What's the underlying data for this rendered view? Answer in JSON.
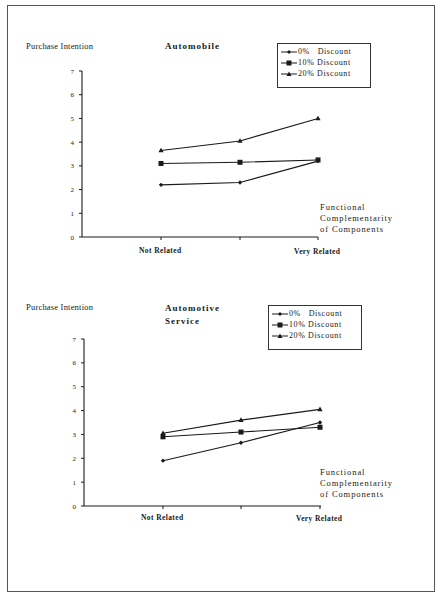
{
  "page": {
    "frame": true,
    "ink_color": "#1a1a1a"
  },
  "chart_data": [
    {
      "type": "line",
      "title": "Automobile",
      "ylabel": "Purchase Intention",
      "xlabel": "Functional Complementarity of Components",
      "xlabel_lines": [
        "Functional",
        "Complementarity",
        "of Components"
      ],
      "x": [
        "Not Related",
        "",
        "Very Related"
      ],
      "x_tick_labels": [
        "Not Related",
        "Very Related"
      ],
      "y_ticks": [
        "0",
        "1",
        "2",
        "3",
        "4",
        "5",
        "6",
        "7"
      ],
      "ylim": [
        0,
        7
      ],
      "grid": false,
      "legend_position": "top-right (boxed)",
      "series": [
        {
          "name": "0% Discount",
          "marker": "diamond",
          "values": [
            2.2,
            2.3,
            3.2
          ]
        },
        {
          "name": "10% Discount",
          "marker": "square",
          "values": [
            3.1,
            3.15,
            3.25
          ]
        },
        {
          "name": "20% Discount",
          "marker": "triangle",
          "values": [
            3.65,
            4.05,
            5.0
          ]
        }
      ]
    },
    {
      "type": "line",
      "title": "Automotive Service",
      "title_lines": [
        "Automotive",
        "Service"
      ],
      "ylabel": "Purchase Intention",
      "xlabel": "Functional Complementarity of Components",
      "xlabel_lines": [
        "Functional",
        "Complementarity",
        "of Components"
      ],
      "x": [
        "Not Related",
        "",
        "Very Related"
      ],
      "x_tick_labels": [
        "Not Related",
        "Very Related"
      ],
      "y_ticks": [
        "0",
        "1",
        "2",
        "3",
        "4",
        "5",
        "6",
        "7"
      ],
      "ylim": [
        0,
        7
      ],
      "grid": false,
      "legend_position": "top-right (boxed)",
      "series": [
        {
          "name": "0% Discount",
          "marker": "diamond",
          "values": [
            1.9,
            2.65,
            3.5
          ]
        },
        {
          "name": "10% Discount",
          "marker": "square",
          "values": [
            2.9,
            3.1,
            3.3
          ]
        },
        {
          "name": "20% Discount",
          "marker": "triangle",
          "values": [
            3.05,
            3.6,
            4.05
          ]
        }
      ]
    }
  ],
  "charts": [
    {
      "ylabel": "Purchase Intention",
      "title": "Automobile",
      "legend": [
        "0%   Discount",
        "10% Discount",
        "20% Discount"
      ],
      "xlabel_lines": [
        "Functional",
        "Complementarity",
        "of Components"
      ],
      "x_tick_labels": [
        "Not Related",
        "Very Related"
      ],
      "y_ticks": [
        "0",
        "1",
        "2",
        "3",
        "4",
        "5",
        "6",
        "7"
      ]
    },
    {
      "ylabel": "Purchase Intention",
      "title_lines": [
        "Automotive",
        "Service"
      ],
      "legend": [
        "0%   Discount",
        "10% Discount",
        "20% Discount"
      ],
      "xlabel_lines": [
        "Functional",
        "Complementarity",
        "of Components"
      ],
      "x_tick_labels": [
        "Not Related",
        "Very Related"
      ],
      "y_ticks": [
        "0",
        "1",
        "2",
        "3",
        "4",
        "5",
        "6",
        "7"
      ]
    }
  ]
}
